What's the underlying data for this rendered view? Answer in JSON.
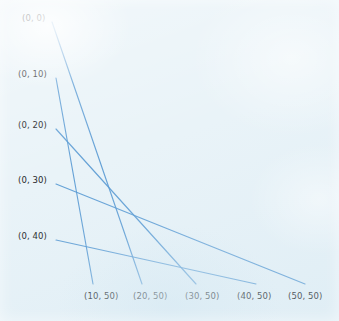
{
  "figure": {
    "width": 339,
    "height": 321,
    "background_color": "#e9f3f8",
    "line_color": "#5a9bd4",
    "label_color": "#1d1d1f"
  },
  "left_labels": [
    {
      "text": "(0, 0)",
      "x": 22,
      "y": 14,
      "anchor_x": 52,
      "anchor_y": 22
    },
    {
      "text": "(0, 10)",
      "x": 18,
      "y": 70,
      "anchor_x": 56,
      "anchor_y": 78
    },
    {
      "text": "(0, 20)",
      "x": 18,
      "y": 121,
      "anchor_x": 56,
      "anchor_y": 129
    },
    {
      "text": "(0, 30)",
      "x": 18,
      "y": 176,
      "anchor_x": 56,
      "anchor_y": 184
    },
    {
      "text": "(0, 40)",
      "x": 18,
      "y": 232,
      "anchor_x": 56,
      "anchor_y": 240
    }
  ],
  "bottom_labels": [
    {
      "text": "(10, 50)",
      "x": 84,
      "y": 292,
      "anchor_x": 93,
      "anchor_y": 284
    },
    {
      "text": "(20, 50)",
      "x": 133,
      "y": 292,
      "anchor_x": 142,
      "anchor_y": 284
    },
    {
      "text": "(30, 50)",
      "x": 185,
      "y": 292,
      "anchor_x": 196,
      "anchor_y": 284
    },
    {
      "text": "(40, 50)",
      "x": 237,
      "y": 292,
      "anchor_x": 256,
      "anchor_y": 284
    },
    {
      "text": "(50, 50)",
      "x": 288,
      "y": 292,
      "anchor_x": 305,
      "anchor_y": 284
    }
  ],
  "edges": [
    {
      "id": "edge-1",
      "from": "(0, 0)",
      "to": "(20, 50)",
      "x1": 52,
      "y1": 22,
      "x2": 142,
      "y2": 284
    },
    {
      "id": "edge-2",
      "from": "(0, 10)",
      "to": "(10, 50)",
      "x1": 56,
      "y1": 78,
      "x2": 93,
      "y2": 284
    },
    {
      "id": "edge-3",
      "from": "(0, 20)",
      "to": "(30, 50)",
      "x1": 56,
      "y1": 129,
      "x2": 196,
      "y2": 284
    },
    {
      "id": "edge-4",
      "from": "(0, 30)",
      "to": "(50, 50)",
      "x1": 56,
      "y1": 184,
      "x2": 305,
      "y2": 284
    },
    {
      "id": "edge-5",
      "from": "(0, 40)",
      "to": "(40, 50)",
      "x1": 56,
      "y1": 240,
      "x2": 256,
      "y2": 284
    }
  ],
  "chart_data": {
    "type": "line",
    "title": "",
    "xlabel": "",
    "ylabel": "",
    "grid": false,
    "legend": "none",
    "nodes_left": [
      "(0, 0)",
      "(0, 10)",
      "(0, 20)",
      "(0, 30)",
      "(0, 40)"
    ],
    "nodes_bottom": [
      "(10, 50)",
      "(20, 50)",
      "(30, 50)",
      "(40, 50)",
      "(50, 50)"
    ],
    "series": [
      {
        "name": "(0, 0) to (20, 50)",
        "x": [
          0,
          20
        ],
        "y": [
          0,
          50
        ]
      },
      {
        "name": "(0, 10) to (10, 50)",
        "x": [
          0,
          10
        ],
        "y": [
          10,
          50
        ]
      },
      {
        "name": "(0, 20) to (30, 50)",
        "x": [
          0,
          30
        ],
        "y": [
          20,
          50
        ]
      },
      {
        "name": "(0, 30) to (50, 50)",
        "x": [
          0,
          50
        ],
        "y": [
          30,
          50
        ]
      },
      {
        "name": "(0, 40) to (40, 50)",
        "x": [
          0,
          40
        ],
        "y": [
          40,
          50
        ]
      }
    ]
  }
}
